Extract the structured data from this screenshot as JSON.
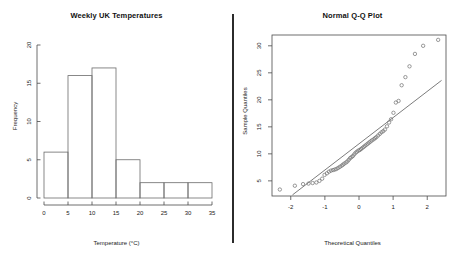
{
  "figure": {
    "divider_color": "#2b2b2b",
    "background": "#ffffff"
  },
  "panels": {
    "histogram": {
      "title": "Weekly UK Temperatures",
      "xlabel": "Temperature (°C)",
      "ylabel": "Frequency"
    },
    "qqplot": {
      "title": "Normal Q-Q Plot",
      "xlabel": "Theoretical Quantiles",
      "ylabel": "Sample Quantiles"
    }
  },
  "chart_data": [
    {
      "type": "bar",
      "title": "Weekly UK Temperatures",
      "xlabel": "Temperature (°C)",
      "ylabel": "Frequency",
      "subtype": "histogram",
      "bin_edges": [
        0,
        5,
        10,
        15,
        20,
        25,
        30,
        35
      ],
      "categories": [
        "0-5",
        "5-10",
        "10-15",
        "15-20",
        "20-25",
        "25-30",
        "30-35"
      ],
      "values": [
        6,
        16,
        17,
        5,
        2,
        2,
        2
      ],
      "xticks": [
        0,
        5,
        10,
        15,
        20,
        25,
        30,
        35
      ],
      "yticks": [
        0,
        5,
        10,
        15,
        20
      ],
      "xlim": [
        0,
        35
      ],
      "ylim": [
        0,
        20
      ],
      "grid": false,
      "legend": "none",
      "bar_fill": "none",
      "bar_stroke": "#6b6b6b"
    },
    {
      "type": "scatter",
      "title": "Normal Q-Q Plot",
      "xlabel": "Theoretical Quantiles",
      "ylabel": "Sample Quantiles",
      "xticks": [
        -2,
        -1,
        0,
        1,
        2
      ],
      "yticks": [
        5,
        10,
        15,
        20,
        25,
        30
      ],
      "xlim": [
        -2.55,
        2.55
      ],
      "ylim": [
        2.2,
        32.0
      ],
      "grid": false,
      "legend": "none",
      "marker": "open-circle",
      "marker_stroke": "#6e6e6e",
      "reference_line": {
        "label": "qqline",
        "x": [
          -1.95,
          2.42
        ],
        "y": [
          2.4,
          23.6
        ],
        "stroke": "#5a5a5a"
      },
      "x": [
        -2.32,
        -1.88,
        -1.64,
        -1.48,
        -1.36,
        -1.25,
        -1.16,
        -1.08,
        -1.01,
        -0.94,
        -0.88,
        -0.82,
        -0.76,
        -0.71,
        -0.66,
        -0.61,
        -0.56,
        -0.51,
        -0.47,
        -0.43,
        -0.38,
        -0.34,
        -0.3,
        -0.26,
        -0.22,
        -0.18,
        -0.14,
        -0.1,
        -0.06,
        -0.02,
        0.02,
        0.06,
        0.1,
        0.14,
        0.18,
        0.22,
        0.26,
        0.3,
        0.34,
        0.38,
        0.43,
        0.47,
        0.51,
        0.56,
        0.61,
        0.66,
        0.71,
        0.76,
        0.82,
        0.88,
        0.94,
        1.01,
        1.08,
        1.16,
        1.25,
        1.36,
        1.48,
        1.64,
        1.88,
        2.32
      ],
      "y": [
        3.4,
        4.1,
        4.4,
        4.5,
        4.6,
        4.7,
        5.0,
        5.4,
        6.1,
        6.4,
        6.7,
        6.9,
        7.0,
        7.1,
        7.2,
        7.4,
        7.6,
        7.8,
        8.0,
        8.2,
        8.4,
        8.6,
        8.9,
        9.2,
        9.4,
        9.6,
        9.9,
        10.2,
        10.4,
        10.6,
        10.7,
        10.9,
        11.1,
        11.3,
        11.5,
        11.7,
        11.9,
        12.1,
        12.3,
        12.5,
        12.7,
        12.9,
        13.1,
        13.4,
        13.7,
        14.0,
        14.2,
        14.5,
        15.1,
        15.8,
        16.4,
        17.6,
        19.5,
        19.8,
        22.7,
        24.2,
        26.2,
        28.5,
        30.0,
        31.1
      ]
    }
  ]
}
